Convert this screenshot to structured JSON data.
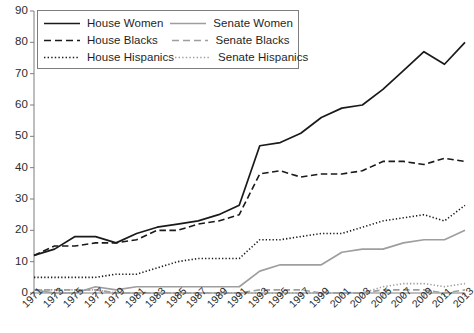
{
  "chart_data": {
    "type": "line",
    "title": "",
    "xlabel": "",
    "ylabel": "",
    "xlim": [
      1971,
      2013
    ],
    "ylim": [
      0,
      90
    ],
    "ytick_step": 10,
    "grid": false,
    "legend_position": "top-left",
    "x": [
      1971,
      1973,
      1975,
      1977,
      1979,
      1981,
      1983,
      1985,
      1987,
      1989,
      1991,
      1993,
      1995,
      1997,
      1999,
      2001,
      2003,
      2005,
      2007,
      2009,
      2011,
      2013
    ],
    "xtick_labels": [
      "1971",
      "1973",
      "1975",
      "1977",
      "1979",
      "1981",
      "1983",
      "1985",
      "1987",
      "1989",
      "1991",
      "1993",
      "1995",
      "1997",
      "1999",
      "2001",
      "2003",
      "2005",
      "2007",
      "2009",
      "2011",
      "2013"
    ],
    "ytick_labels": [
      "0",
      "10",
      "20",
      "30",
      "40",
      "50",
      "60",
      "70",
      "80",
      "90"
    ],
    "series": [
      {
        "name": "House Women",
        "style": "solid",
        "color": "#1a1a1a",
        "values": [
          12,
          14,
          18,
          18,
          16,
          19,
          21,
          22,
          23,
          25,
          28,
          47,
          48,
          51,
          56,
          59,
          60,
          65,
          71,
          77,
          73,
          80
        ]
      },
      {
        "name": "House Blacks",
        "style": "dashed",
        "color": "#1a1a1a",
        "values": [
          12,
          15,
          15,
          16,
          16,
          17,
          20,
          20,
          22,
          23,
          25,
          38,
          39,
          37,
          38,
          38,
          39,
          42,
          42,
          41,
          43,
          42
        ]
      },
      {
        "name": "House Hispanics",
        "style": "dotted",
        "color": "#1a1a1a",
        "values": [
          5,
          5,
          5,
          5,
          6,
          6,
          8,
          10,
          11,
          11,
          11,
          17,
          17,
          18,
          19,
          19,
          21,
          23,
          24,
          25,
          23,
          28
        ]
      },
      {
        "name": "Senate Women",
        "style": "solid",
        "color": "#9e9e9e",
        "values": [
          1,
          0,
          0,
          2,
          1,
          2,
          2,
          2,
          2,
          2,
          2,
          7,
          9,
          9,
          9,
          13,
          14,
          14,
          16,
          17,
          17,
          20
        ]
      },
      {
        "name": "Senate Blacks",
        "style": "dashed",
        "color": "#9e9e9e",
        "values": [
          1,
          1,
          1,
          1,
          0,
          0,
          0,
          0,
          0,
          0,
          0,
          1,
          1,
          1,
          0,
          0,
          0,
          1,
          1,
          1,
          0,
          1
        ]
      },
      {
        "name": "Senate Hispanics",
        "style": "dotted",
        "color": "#9e9e9e",
        "values": [
          1,
          1,
          1,
          1,
          0,
          0,
          0,
          0,
          0,
          0,
          0,
          0,
          0,
          0,
          0,
          0,
          0,
          2,
          3,
          3,
          2,
          3
        ]
      }
    ]
  },
  "legend": {
    "rows": [
      {
        "left": "House Women",
        "right": "Senate Women"
      },
      {
        "left": "House Blacks",
        "right": "Senate Blacks"
      },
      {
        "left": "House Hispanics",
        "right": "Senate Hispanics"
      }
    ]
  },
  "colors": {
    "house": "#1a1a1a",
    "senate": "#9e9e9e",
    "axis": "#7d7d7d",
    "background": "#ffffff"
  }
}
